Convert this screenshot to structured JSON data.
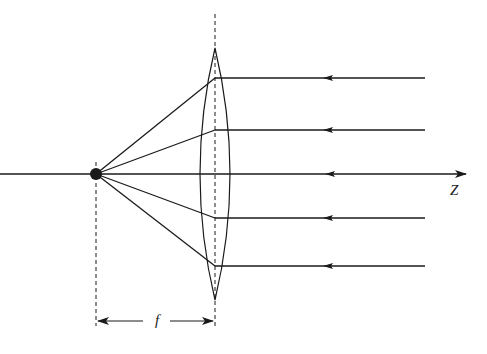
{
  "diagram": {
    "labels": {
      "axis": "Z",
      "focal_length": "f"
    },
    "colors": {
      "ink": "#1a1a1a",
      "background": "#ffffff"
    },
    "elements": {
      "lens": {
        "center_x": 215,
        "top_y": 48,
        "bottom_y": 300,
        "half_width": 15
      },
      "focal_point": {
        "x": 96,
        "y": 174
      },
      "optical_axis": {
        "y": 174,
        "x_start": 0,
        "x_end": 468
      },
      "incoming_rays_y": [
        78,
        130,
        218,
        266
      ],
      "axis_ray_arrow_x": 330
    }
  }
}
